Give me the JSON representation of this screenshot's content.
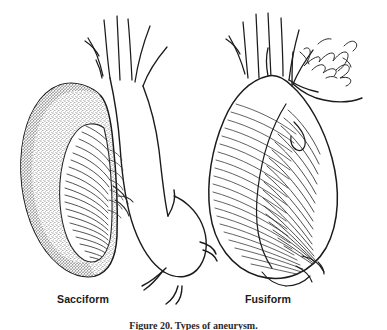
{
  "figure": {
    "kind": "medical-line-illustration",
    "background_color": "#ffffff",
    "ink_color": "#1b1b1b",
    "caption": "Figure 20. Types of aneurysm.",
    "signature": {
      "present": true,
      "style": "cursive-handwritten",
      "line1": "Hal",
      "line2": "Smith"
    }
  },
  "panels": [
    {
      "id": "sacciform",
      "label": "Sacciform",
      "label_position": {
        "x": 57,
        "y": 293
      },
      "description": "Saccular out-pouching on the aortic arch, stippled outer wall with curved interior hatching showing the opened sac cavity",
      "shading": "stipple-and-hatch"
    },
    {
      "id": "fusiform",
      "label": "Fusiform",
      "label_position": {
        "x": 245,
        "y": 293
      },
      "description": "Pear-shaped spindle dilation of the aorta, rendered with fine contour hatching",
      "shading": "contour-hatch"
    }
  ],
  "anatomy": {
    "arch_branches_label": "aortic arch branch vessels",
    "branch_count_left": 5,
    "branch_count_right": 5,
    "descending_aorta_label": "descending aorta"
  },
  "colors": {
    "ink": "#1b1b1b",
    "hatch": "#3a3a3a",
    "stipple": "#555555",
    "paper": "#ffffff",
    "label_text": "#1b1b1b"
  }
}
